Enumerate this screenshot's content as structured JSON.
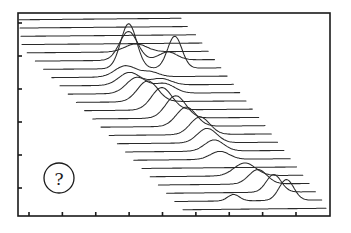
{
  "chart_data": {
    "type": "line",
    "subtype": "waterfall-stacked-spectra",
    "title": "",
    "xlabel": "",
    "ylabel": "",
    "x_tick_count": 9,
    "y_tick_count": 6,
    "grid": false,
    "legend": "none",
    "annotation": {
      "label": "?",
      "shape": "circle",
      "placement": "bottom-left"
    },
    "ink_color": "#2a2a2a",
    "series_note": "Stacked traces; each offset down and to the right. Peaks given as (position along trace 0-1, height in baseline units, width).",
    "series": [
      {
        "name": "trace-1",
        "peaks": []
      },
      {
        "name": "trace-2",
        "peaks": []
      },
      {
        "name": "trace-3",
        "peaks": []
      },
      {
        "name": "trace-4",
        "peaks": []
      },
      {
        "name": "trace-5",
        "peaks": [
          [
            0.6,
            1.0,
            0.06
          ]
        ]
      },
      {
        "name": "trace-6",
        "peaks": [
          [
            0.52,
            3.6,
            0.05
          ],
          [
            0.74,
            1.0,
            0.05
          ]
        ]
      },
      {
        "name": "trace-7",
        "peaks": [
          [
            0.48,
            5.6,
            0.045
          ],
          [
            0.74,
            4.0,
            0.04
          ]
        ]
      },
      {
        "name": "trace-8",
        "peaks": [
          [
            0.42,
            1.4,
            0.06
          ],
          [
            0.56,
            0.6,
            0.05
          ]
        ]
      },
      {
        "name": "trace-9",
        "peaks": [
          [
            0.4,
            1.6,
            0.06
          ],
          [
            0.58,
            0.8,
            0.06
          ]
        ]
      },
      {
        "name": "trace-10",
        "peaks": [
          [
            0.4,
            2.0,
            0.06
          ],
          [
            0.56,
            1.2,
            0.06
          ]
        ]
      },
      {
        "name": "trace-11",
        "peaks": [
          [
            0.42,
            2.6,
            0.06
          ]
        ]
      },
      {
        "name": "trace-12",
        "peaks": [
          [
            0.46,
            2.8,
            0.06
          ]
        ]
      },
      {
        "name": "trace-13",
        "peaks": [
          [
            0.5,
            2.8,
            0.06
          ]
        ]
      },
      {
        "name": "trace-14",
        "peaks": [
          [
            0.52,
            2.4,
            0.06
          ]
        ]
      },
      {
        "name": "trace-15",
        "peaks": [
          [
            0.56,
            2.2,
            0.06
          ]
        ]
      },
      {
        "name": "trace-16",
        "peaks": [
          [
            0.56,
            1.8,
            0.06
          ]
        ]
      },
      {
        "name": "trace-17",
        "peaks": [
          [
            0.56,
            1.4,
            0.06
          ]
        ]
      },
      {
        "name": "trace-18",
        "peaks": [
          [
            0.55,
            1.0,
            0.06
          ]
        ]
      },
      {
        "name": "trace-19",
        "peaks": []
      },
      {
        "name": "trace-20",
        "peaks": [
          [
            0.62,
            1.6,
            0.07
          ]
        ]
      },
      {
        "name": "trace-21",
        "peaks": [
          [
            0.66,
            1.8,
            0.06
          ]
        ]
      },
      {
        "name": "trace-22",
        "peaks": [
          [
            0.72,
            2.2,
            0.05
          ]
        ]
      },
      {
        "name": "trace-23",
        "peaks": [
          [
            0.4,
            0.8,
            0.04
          ],
          [
            0.76,
            2.6,
            0.05
          ]
        ]
      },
      {
        "name": "trace-24",
        "peaks": []
      }
    ],
    "xlim": [
      0,
      1
    ],
    "ylim": [
      0,
      1
    ]
  }
}
